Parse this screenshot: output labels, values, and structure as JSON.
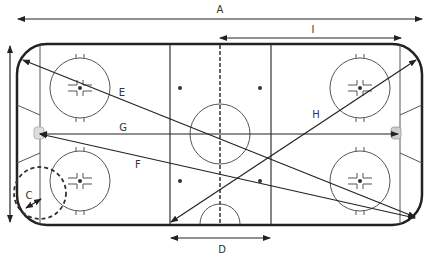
{
  "diagram": {
    "type": "hockey-rink-dimensions",
    "colors": {
      "line": "#222222",
      "thin": "#555555",
      "goal": "#cccccc",
      "background": "#ffffff"
    },
    "labels": {
      "A": "A",
      "B": "B",
      "C": "C",
      "D": "D",
      "E": "E",
      "F": "F",
      "G": "G",
      "H": "H",
      "I": "I"
    },
    "measurements": [
      {
        "id": "A",
        "description": "total rink length (top arrow)"
      },
      {
        "id": "B",
        "description": "total rink width (left vertical arrow)"
      },
      {
        "id": "C",
        "description": "corner radius"
      },
      {
        "id": "D",
        "description": "neutral zone width"
      },
      {
        "id": "E",
        "description": "diagonal top-left corner to bottom-right corner"
      },
      {
        "id": "F",
        "description": "left goal to bottom-right corner"
      },
      {
        "id": "G",
        "description": "goal line to goal line distance"
      },
      {
        "id": "H",
        "description": "bottom blue line to top-right corner"
      },
      {
        "id": "I",
        "description": "center line to end boards"
      }
    ]
  }
}
